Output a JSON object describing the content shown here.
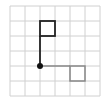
{
  "diagram": {
    "type": "grid-figure",
    "grid": {
      "columns": 6,
      "rows": 6,
      "line_color": "#d0d0d0"
    },
    "origin_point": {
      "col": 2,
      "row": 4,
      "color": "#111111"
    },
    "black_figure": {
      "color": "#222222",
      "stem": {
        "from": [
          2,
          4
        ],
        "to": [
          2,
          2
        ]
      },
      "square": {
        "col": 2,
        "row": 1,
        "size": 1
      }
    },
    "gray_figure": {
      "color": "#888888",
      "stem": {
        "from": [
          2,
          4
        ],
        "to": [
          4,
          4
        ]
      },
      "square": {
        "col": 4,
        "row": 4,
        "size": 1
      }
    }
  }
}
